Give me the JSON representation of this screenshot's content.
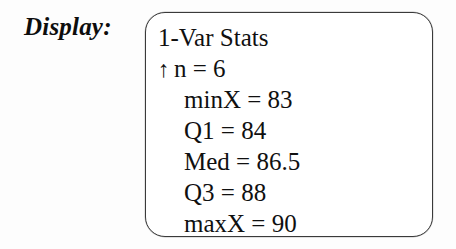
{
  "figure": {
    "label": "Display:",
    "calculator_screen": {
      "header": "1-Var Stats",
      "scroll_indicator": "↑",
      "rows": [
        {
          "text": "n = 6",
          "indicator": "↑",
          "name": "stat-n"
        },
        {
          "text": "minX = 83",
          "name": "stat-minx"
        },
        {
          "text": "Q1 = 84",
          "name": "stat-q1"
        },
        {
          "text": "Med = 86.5",
          "name": "stat-med"
        },
        {
          "text": "Q3 = 88",
          "name": "stat-q3"
        },
        {
          "text": "maxX = 90",
          "name": "stat-maxx"
        }
      ]
    }
  },
  "stats": {
    "n": "n = 6",
    "minX": "minX = 83",
    "Q1": "Q1 = 84",
    "Med": "Med = 86.5",
    "Q3": "Q3 = 88",
    "maxX": "maxX = 90"
  },
  "colors": {
    "ink": "#101010",
    "border": "#3a3a3a",
    "paper": "#fdfdfd",
    "screen": "#ffffff"
  }
}
